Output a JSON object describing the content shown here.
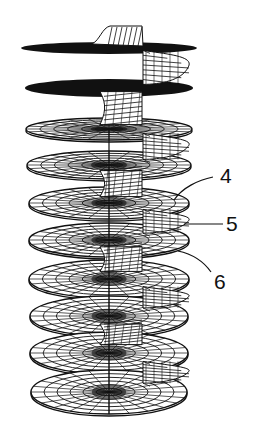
{
  "figure": {
    "line_color": "#111111",
    "background": "#ffffff",
    "disc_count": 10,
    "discs": [
      {
        "cy": 48,
        "rx": 88,
        "ry": 6,
        "style": "solid"
      },
      {
        "cy": 88,
        "rx": 84,
        "ry": 9,
        "style": "solid"
      },
      {
        "cy": 129,
        "rx": 83,
        "ry": 11,
        "style": "mesh"
      },
      {
        "cy": 165,
        "rx": 82,
        "ry": 14,
        "style": "mesh"
      },
      {
        "cy": 203,
        "rx": 80,
        "ry": 16,
        "style": "mesh"
      },
      {
        "cy": 240,
        "rx": 80,
        "ry": 17,
        "style": "mesh"
      },
      {
        "cy": 279,
        "rx": 80,
        "ry": 19,
        "style": "mesh"
      },
      {
        "cy": 316,
        "rx": 79,
        "ry": 20,
        "style": "mesh"
      },
      {
        "cy": 353,
        "rx": 79,
        "ry": 21,
        "style": "mesh"
      },
      {
        "cy": 392,
        "rx": 78,
        "ry": 22,
        "style": "mesh"
      }
    ]
  },
  "labels": [
    {
      "id": "4",
      "text": "4",
      "x": 220,
      "y": 165
    },
    {
      "id": "5",
      "text": "5",
      "x": 226,
      "y": 213
    },
    {
      "id": "6",
      "text": "6",
      "x": 214,
      "y": 271
    }
  ]
}
